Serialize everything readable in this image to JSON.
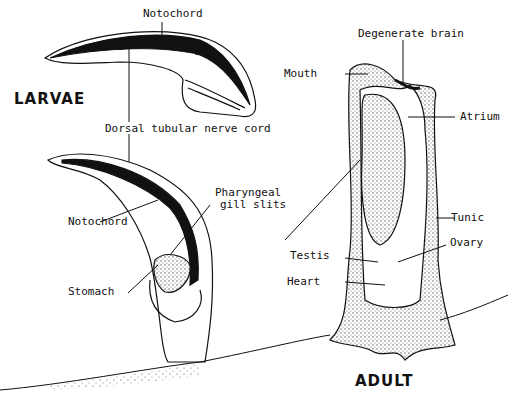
{
  "diagram": {
    "title_larvae": "LARVAE",
    "title_adult": "ADULT",
    "labels": {
      "notochord_top": "Notochord",
      "dorsal_nerve_cord": "Dorsal tubular nerve cord",
      "notochord_mid": "Notochord",
      "pharyngeal_line1": "Pharyngeal",
      "pharyngeal_line2": "gill slits",
      "stomach": "Stomach",
      "degenerate_brain": "Degenerate brain",
      "mouth": "Mouth",
      "atrium": "Atrium",
      "tunic": "Tunic",
      "ovary": "Ovary",
      "testis": "Testis",
      "heart": "Heart"
    },
    "colors": {
      "ink": "#111111",
      "stipple": "#c8c8c8",
      "background": "#ffffff"
    }
  }
}
